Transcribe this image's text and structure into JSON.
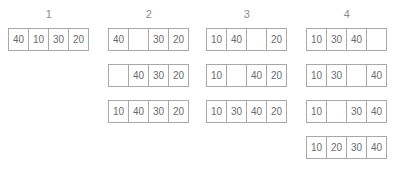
{
  "diagram": {
    "cell_border_color": "#a8a8a8",
    "cell_text_color": "#6b6b6b",
    "header_text_color": "#8c8c8c",
    "background_color": "#ffffff",
    "empty_cell_marker": ""
  },
  "columns": [
    {
      "header": "1",
      "left": 8,
      "rows": [
        {
          "top": 0,
          "cells": [
            "40",
            "10",
            "30",
            "20"
          ]
        }
      ]
    },
    {
      "header": "2",
      "left": 108,
      "rows": [
        {
          "top": 0,
          "cells": [
            "40",
            "",
            "30",
            "20"
          ]
        },
        {
          "top": 36,
          "cells": [
            "",
            "40",
            "30",
            "20"
          ]
        },
        {
          "top": 72,
          "cells": [
            "10",
            "40",
            "30",
            "20"
          ]
        }
      ]
    },
    {
      "header": "3",
      "left": 206,
      "rows": [
        {
          "top": 0,
          "cells": [
            "10",
            "40",
            "",
            "20"
          ]
        },
        {
          "top": 36,
          "cells": [
            "10",
            "",
            "40",
            "20"
          ]
        },
        {
          "top": 72,
          "cells": [
            "10",
            "30",
            "40",
            "20"
          ]
        }
      ]
    },
    {
      "header": "4",
      "left": 306,
      "rows": [
        {
          "top": 0,
          "cells": [
            "10",
            "30",
            "40",
            ""
          ]
        },
        {
          "top": 36,
          "cells": [
            "10",
            "30",
            "",
            "40"
          ]
        },
        {
          "top": 72,
          "cells": [
            "10",
            "",
            "30",
            "40"
          ]
        },
        {
          "top": 108,
          "cells": [
            "10",
            "20",
            "30",
            "40"
          ]
        }
      ]
    }
  ]
}
